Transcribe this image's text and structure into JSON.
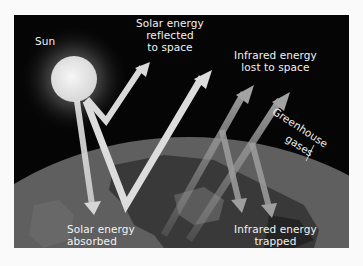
{
  "diagram": {
    "labels": {
      "sun": "Sun",
      "reflected": [
        "Solar energy",
        "reflected",
        "to space"
      ],
      "lost": [
        "Infrared energy",
        "lost to space"
      ],
      "greenhouse": [
        "Greenhouse",
        "gases"
      ],
      "absorbed": [
        "Solar energy",
        "absorbed"
      ],
      "trapped": [
        "Infrared energy",
        "trapped"
      ]
    },
    "colors": {
      "space": "#050505",
      "atmosphere": "#8a8a8a",
      "earth": "#5e5e5e",
      "land": "#2a2a2a",
      "solar_arrow": "#d9d9d9",
      "infrared_arrow": "#9a9a9a",
      "text": "#f2f2f2"
    }
  }
}
